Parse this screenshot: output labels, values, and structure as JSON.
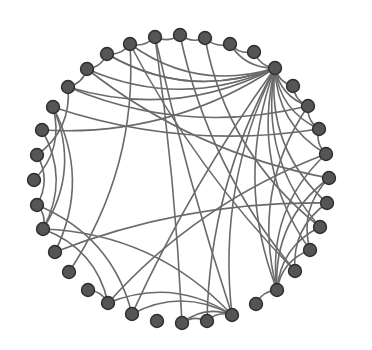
{
  "diagram": {
    "type": "circular-network-graph",
    "node_radius": 6.5,
    "colors": {
      "node_fill": "#555555",
      "node_stroke": "#2e2e2e",
      "edge": "#6a6a6a",
      "background": "#ffffff"
    },
    "nodes": [
      {
        "id": 0,
        "x": 275,
        "y": 68
      },
      {
        "id": 1,
        "x": 293,
        "y": 86
      },
      {
        "id": 2,
        "x": 308,
        "y": 106
      },
      {
        "id": 3,
        "x": 319,
        "y": 129
      },
      {
        "id": 4,
        "x": 326,
        "y": 154
      },
      {
        "id": 5,
        "x": 329,
        "y": 178
      },
      {
        "id": 6,
        "x": 327,
        "y": 203
      },
      {
        "id": 7,
        "x": 320,
        "y": 227
      },
      {
        "id": 8,
        "x": 310,
        "y": 250
      },
      {
        "id": 9,
        "x": 295,
        "y": 271
      },
      {
        "id": 10,
        "x": 277,
        "y": 290
      },
      {
        "id": 11,
        "x": 256,
        "y": 304
      },
      {
        "id": 12,
        "x": 232,
        "y": 315
      },
      {
        "id": 13,
        "x": 207,
        "y": 321
      },
      {
        "id": 14,
        "x": 182,
        "y": 323
      },
      {
        "id": 15,
        "x": 157,
        "y": 321
      },
      {
        "id": 16,
        "x": 132,
        "y": 314
      },
      {
        "id": 17,
        "x": 108,
        "y": 303
      },
      {
        "id": 18,
        "x": 88,
        "y": 290
      },
      {
        "id": 19,
        "x": 69,
        "y": 272
      },
      {
        "id": 20,
        "x": 55,
        "y": 252
      },
      {
        "id": 21,
        "x": 43,
        "y": 229
      },
      {
        "id": 22,
        "x": 37,
        "y": 205
      },
      {
        "id": 23,
        "x": 34,
        "y": 180
      },
      {
        "id": 24,
        "x": 37,
        "y": 155
      },
      {
        "id": 25,
        "x": 42,
        "y": 130
      },
      {
        "id": 26,
        "x": 53,
        "y": 107
      },
      {
        "id": 27,
        "x": 68,
        "y": 87
      },
      {
        "id": 28,
        "x": 87,
        "y": 69
      },
      {
        "id": 29,
        "x": 107,
        "y": 54
      },
      {
        "id": 30,
        "x": 130,
        "y": 44
      },
      {
        "id": 31,
        "x": 155,
        "y": 37
      },
      {
        "id": 32,
        "x": 180,
        "y": 35
      },
      {
        "id": 33,
        "x": 205,
        "y": 38
      },
      {
        "id": 34,
        "x": 230,
        "y": 44
      },
      {
        "id": 35,
        "x": 254,
        "y": 52
      }
    ],
    "edges": [
      [
        0,
        1
      ],
      [
        0,
        2
      ],
      [
        0,
        3
      ],
      [
        0,
        4
      ],
      [
        0,
        6
      ],
      [
        0,
        7
      ],
      [
        0,
        8
      ],
      [
        0,
        10
      ],
      [
        0,
        12
      ],
      [
        0,
        13
      ],
      [
        0,
        16
      ],
      [
        0,
        27
      ],
      [
        0,
        28
      ],
      [
        0,
        29
      ],
      [
        0,
        30
      ],
      [
        0,
        35
      ],
      [
        0,
        34
      ],
      [
        1,
        2
      ],
      [
        2,
        3
      ],
      [
        3,
        4
      ],
      [
        4,
        10
      ],
      [
        4,
        17
      ],
      [
        5,
        8
      ],
      [
        5,
        10
      ],
      [
        6,
        9
      ],
      [
        7,
        10
      ],
      [
        8,
        10
      ],
      [
        10,
        11
      ],
      [
        10,
        2
      ],
      [
        12,
        13
      ],
      [
        12,
        14
      ],
      [
        12,
        16
      ],
      [
        12,
        17
      ],
      [
        12,
        31
      ],
      [
        12,
        21
      ],
      [
        13,
        14
      ],
      [
        16,
        22
      ],
      [
        17,
        18
      ],
      [
        17,
        21
      ],
      [
        19,
        30
      ],
      [
        21,
        22
      ],
      [
        21,
        25
      ],
      [
        21,
        26
      ],
      [
        22,
        24
      ],
      [
        23,
        26
      ],
      [
        24,
        27
      ],
      [
        20,
        26
      ],
      [
        20,
        6
      ],
      [
        27,
        28
      ],
      [
        28,
        29
      ],
      [
        29,
        30
      ],
      [
        30,
        31
      ],
      [
        31,
        32
      ],
      [
        32,
        33
      ],
      [
        33,
        34
      ],
      [
        34,
        35
      ],
      [
        27,
        2
      ],
      [
        28,
        5
      ],
      [
        29,
        0
      ],
      [
        32,
        9
      ],
      [
        33,
        7
      ],
      [
        26,
        3
      ],
      [
        25,
        0
      ],
      [
        31,
        14
      ],
      [
        30,
        9
      ]
    ]
  }
}
